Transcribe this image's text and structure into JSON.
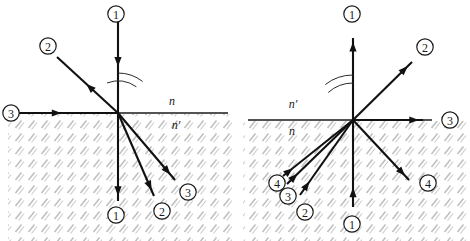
{
  "figure": {
    "background_color": "#ffffff",
    "ray_color": "#111111",
    "hatch_color": "#b9b9b9",
    "interface_color": "#1a1a1a",
    "width": 470,
    "height": 241
  },
  "panels": [
    {
      "id": "left",
      "name": "left-diagram",
      "origin": {
        "x": 118,
        "y": 113
      },
      "interface": {
        "x1": 8,
        "y1": 113,
        "x2": 228,
        "y2": 113
      },
      "media_labels": [
        {
          "text": "n",
          "x": 172,
          "y": 101,
          "position": "above-interface"
        },
        {
          "text": "n′",
          "x": 176,
          "y": 125,
          "position": "below-interface"
        }
      ],
      "rays": [
        {
          "label": "1",
          "region": "above",
          "direction": "incoming",
          "heading": "down",
          "x1": 118,
          "y1": 16,
          "x2": 118,
          "y2": 113,
          "arrow_t": 0.52
        },
        {
          "label": "2",
          "region": "above",
          "direction": "outgoing",
          "heading": "up-left",
          "x1": 118,
          "y1": 113,
          "x2": 57,
          "y2": 57,
          "arrow_t": 0.52
        },
        {
          "label": "3",
          "region": "above",
          "direction": "incoming",
          "heading": "right",
          "x1": 13,
          "y1": 113,
          "x2": 118,
          "y2": 113,
          "arrow_t": 0.46
        },
        {
          "label": "1",
          "region": "below",
          "direction": "outgoing",
          "heading": "down",
          "x1": 118,
          "y1": 113,
          "x2": 118,
          "y2": 201,
          "arrow_t": 0.94
        },
        {
          "label": "2",
          "region": "below",
          "direction": "outgoing",
          "heading": "down-right",
          "x1": 118,
          "y1": 113,
          "x2": 154,
          "y2": 196,
          "arrow_t": 0.93
        },
        {
          "label": "3",
          "region": "below",
          "direction": "outgoing",
          "heading": "down-right",
          "x1": 118,
          "y1": 113,
          "x2": 175,
          "y2": 180,
          "arrow_t": 0.92
        }
      ],
      "ray_labels": [
        {
          "text": "1",
          "x": 116,
          "y": 14
        },
        {
          "text": "2",
          "x": 48,
          "y": 46
        },
        {
          "text": "3",
          "x": 11,
          "y": 113
        },
        {
          "text": "1",
          "x": 116,
          "y": 215
        },
        {
          "text": "2",
          "x": 162,
          "y": 211
        },
        {
          "text": "3",
          "x": 188,
          "y": 192
        }
      ],
      "angle_arcs": [
        {
          "name": "refraction-angle-arc",
          "radius": 32,
          "start_deg": 250,
          "end_deg": 305
        },
        {
          "name": "refraction-angle-arc-inner",
          "radius": 40,
          "start_deg": 270,
          "end_deg": 308
        }
      ]
    },
    {
      "id": "right",
      "name": "right-diagram",
      "origin": {
        "x": 353,
        "y": 120
      },
      "interface": {
        "x1": 248,
        "y1": 120,
        "x2": 432,
        "y2": 120
      },
      "media_labels": [
        {
          "text": "n′",
          "x": 293,
          "y": 104,
          "position": "above-interface"
        },
        {
          "text": "n",
          "x": 292,
          "y": 131,
          "position": "below-interface"
        }
      ],
      "rays": [
        {
          "label": "1",
          "region": "above",
          "direction": "outgoing",
          "heading": "up",
          "x1": 353,
          "y1": 120,
          "x2": 353,
          "y2": 38,
          "arrow_t": 0.95
        },
        {
          "label": "2",
          "region": "above",
          "direction": "outgoing",
          "heading": "up-right",
          "x1": 353,
          "y1": 120,
          "x2": 412,
          "y2": 62,
          "arrow_t": 0.93
        },
        {
          "label": "3",
          "region": "above",
          "direction": "outgoing",
          "heading": "right",
          "x1": 353,
          "y1": 120,
          "x2": 423,
          "y2": 120,
          "arrow_t": 0.94
        },
        {
          "label": "4",
          "region": "below",
          "direction": "outgoing",
          "heading": "down-right",
          "x1": 353,
          "y1": 120,
          "x2": 409,
          "y2": 180,
          "arrow_t": 0.93
        },
        {
          "label": "1",
          "region": "below",
          "direction": "incoming",
          "heading": "up",
          "x1": 353,
          "y1": 207,
          "x2": 353,
          "y2": 120,
          "arrow_t": 0.22
        },
        {
          "label": "2",
          "region": "below",
          "direction": "incoming",
          "heading": "up-right",
          "x1": 300,
          "y1": 195,
          "x2": 353,
          "y2": 120,
          "arrow_t": 0.18
        },
        {
          "label": "3",
          "region": "below",
          "direction": "incoming",
          "heading": "up-right",
          "x1": 287,
          "y1": 184,
          "x2": 353,
          "y2": 120,
          "arrow_t": 0.16
        },
        {
          "label": "4",
          "region": "below",
          "direction": "incoming",
          "heading": "up-right",
          "x1": 283,
          "y1": 176,
          "x2": 353,
          "y2": 120,
          "arrow_t": 0.14
        }
      ],
      "ray_labels": [
        {
          "text": "1",
          "x": 352,
          "y": 14
        },
        {
          "text": "2",
          "x": 425,
          "y": 47
        },
        {
          "text": "3",
          "x": 450,
          "y": 120
        },
        {
          "text": "4",
          "x": 428,
          "y": 183
        },
        {
          "text": "4",
          "x": 277,
          "y": 183
        },
        {
          "text": "3",
          "x": 288,
          "y": 196
        },
        {
          "text": "2",
          "x": 305,
          "y": 212
        },
        {
          "text": "1",
          "x": 352,
          "y": 224
        }
      ],
      "angle_arcs": [
        {
          "name": "incidence-angle-arc",
          "radius": 37,
          "start_deg": 228,
          "end_deg": 270
        },
        {
          "name": "incidence-angle-arc-inner",
          "radius": 45,
          "start_deg": 232,
          "end_deg": 270
        }
      ]
    }
  ],
  "caption": ""
}
